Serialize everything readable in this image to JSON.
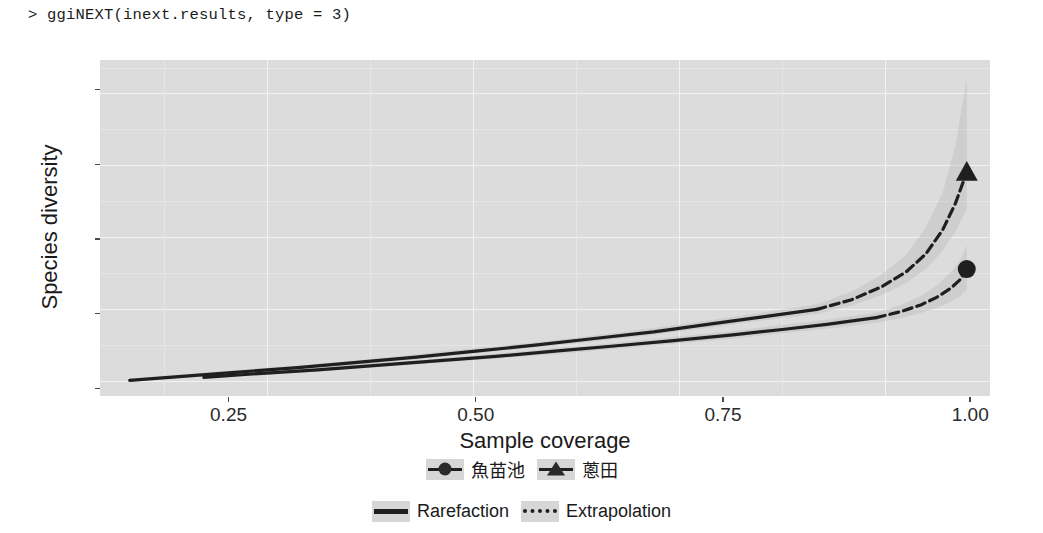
{
  "console": {
    "prompt": ">",
    "command": "ggiNEXT(inext.results, type = 3)",
    "full_line": "> ggiNEXT(inext.results, type = 3)"
  },
  "chart_data": {
    "type": "line",
    "title": "",
    "subtitle": "",
    "xlabel": "Sample coverage",
    "ylabel": "Species diversity",
    "xlim": [
      0.12,
      1.02
    ],
    "ylim": [
      -1,
      44
    ],
    "xticks": [
      "0.25",
      "0.50",
      "0.75",
      "1.00"
    ],
    "xtick_values": [
      0.25,
      0.5,
      0.75,
      1.0
    ],
    "yticks": [
      "0",
      "10",
      "20",
      "30",
      "40"
    ],
    "ytick_values": [
      0,
      10,
      20,
      30,
      40
    ],
    "grid": true,
    "grid_color": "#f2f2f2",
    "panel_background": "#dcdcdc",
    "legend_position": "bottom",
    "band_opacity": 0.35,
    "series": [
      {
        "name": "蔥田",
        "marker": "triangle",
        "observed_point": {
          "x": 0.9965,
          "y": 29.0
        },
        "reference_coverage": 0.845,
        "line_color": "#1f1f1f",
        "band_color": "#b4b4b4",
        "x": [
          0.15,
          0.2,
          0.26,
          0.32,
          0.38,
          0.44,
          0.5,
          0.56,
          0.62,
          0.68,
          0.74,
          0.79,
          0.845,
          0.88,
          0.91,
          0.935,
          0.955,
          0.972,
          0.985,
          0.9965
        ],
        "y": [
          1.1,
          1.6,
          2.2,
          2.8,
          3.5,
          4.2,
          5.0,
          5.8,
          6.7,
          7.6,
          8.7,
          9.6,
          10.6,
          11.9,
          13.6,
          15.6,
          18.0,
          21.2,
          24.8,
          29.0
        ],
        "y_lower": [
          1.0,
          1.4,
          2.0,
          2.6,
          3.2,
          3.9,
          4.7,
          5.5,
          6.3,
          7.2,
          8.2,
          9.1,
          10.0,
          11.1,
          12.5,
          14.1,
          16.0,
          18.4,
          21.0,
          24.0
        ],
        "y_upper": [
          1.3,
          1.9,
          2.5,
          3.1,
          3.8,
          4.6,
          5.4,
          6.2,
          7.1,
          8.1,
          9.2,
          10.2,
          11.3,
          13.0,
          15.2,
          17.9,
          21.5,
          26.2,
          32.5,
          41.5
        ]
      },
      {
        "name": "魚苗池",
        "marker": "circle",
        "observed_point": {
          "x": 0.9965,
          "y": 16.0
        },
        "reference_coverage": 0.905,
        "line_color": "#1f1f1f",
        "band_color": "#b4b4b4",
        "x": [
          0.225,
          0.28,
          0.34,
          0.4,
          0.46,
          0.52,
          0.58,
          0.64,
          0.7,
          0.76,
          0.81,
          0.855,
          0.905,
          0.93,
          0.95,
          0.966,
          0.98,
          0.99,
          0.9965
        ],
        "y": [
          1.5,
          2.0,
          2.5,
          3.1,
          3.7,
          4.3,
          5.0,
          5.7,
          6.4,
          7.2,
          7.9,
          8.6,
          9.5,
          10.3,
          11.2,
          12.2,
          13.4,
          14.6,
          16.0
        ],
        "y_lower": [
          1.4,
          1.8,
          2.3,
          2.9,
          3.4,
          4.0,
          4.6,
          5.3,
          6.0,
          6.7,
          7.4,
          8.0,
          8.8,
          9.4,
          10.1,
          10.8,
          11.6,
          12.4,
          13.2
        ],
        "y_upper": [
          1.7,
          2.2,
          2.8,
          3.4,
          4.0,
          4.7,
          5.4,
          6.1,
          6.9,
          7.7,
          8.5,
          9.2,
          10.2,
          11.2,
          12.4,
          13.8,
          15.5,
          17.2,
          19.2
        ]
      }
    ]
  },
  "legends": {
    "groups": {
      "entries": [
        {
          "label": "魚苗池",
          "marker": "circle"
        },
        {
          "label": "蔥田",
          "marker": "triangle"
        }
      ]
    },
    "methods": {
      "entries": [
        {
          "label": "Rarefaction",
          "linetype": "solid"
        },
        {
          "label": "Extrapolation",
          "linetype": "dashed"
        }
      ]
    }
  },
  "axes": {
    "x": {
      "title": "Sample coverage",
      "ticks": [
        "0.25",
        "0.50",
        "0.75",
        "1.00"
      ]
    },
    "y": {
      "title": "Species diversity",
      "ticks": [
        "40",
        "30",
        "20",
        "10",
        "0"
      ]
    }
  }
}
